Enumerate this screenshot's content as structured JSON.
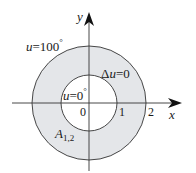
{
  "diagram": {
    "type": "annulus-boundary-value-problem",
    "colors": {
      "region_fill": "#e4e6e9",
      "stroke": "#333333",
      "background": "#ffffff"
    },
    "axes": {
      "x_label": "x",
      "y_label": "y",
      "origin_label": "0",
      "x_ticks": [
        "1",
        "2"
      ]
    },
    "labels": {
      "outer_boundary_var": "u",
      "outer_boundary_eq": "=100",
      "outer_boundary_deg": "°",
      "inner_boundary_var": "u",
      "inner_boundary_eq": "=0",
      "inner_boundary_deg": "°",
      "pde_delta": "Δ",
      "pde_var": "u",
      "pde_eq": "=0",
      "region_name": "A",
      "region_sub": "1,2"
    },
    "geometry": {
      "inner_radius": 1,
      "outer_radius": 2
    }
  }
}
